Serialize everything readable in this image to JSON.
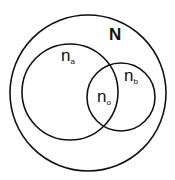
{
  "diagram": {
    "type": "venn",
    "universe": {
      "label": "N"
    },
    "sets": [
      {
        "id": "a",
        "label": "n",
        "subscript": "a"
      },
      {
        "id": "b",
        "label": "n",
        "subscript": "b"
      }
    ],
    "intersection": {
      "label": "n",
      "subscript": "o"
    }
  },
  "colors": {
    "stroke": "#111111",
    "background": "#ffffff"
  }
}
